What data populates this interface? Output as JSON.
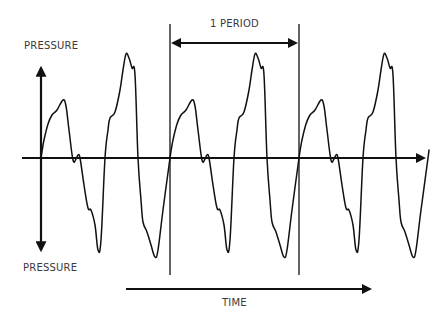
{
  "labels": {
    "pressure_top": "PRESSURE",
    "pressure_bottom": "PRESSURE",
    "period": "1 PERIOD",
    "time": "TIME"
  },
  "colors": {
    "stroke": "#111111",
    "text": "#3a3a3a",
    "background": "#ffffff"
  },
  "geometry": {
    "baseline_y": 158,
    "wave_start_x": 41,
    "period_px": 129,
    "cycles": 3,
    "period_marker_x": [
      170,
      299
    ]
  },
  "chart_data": {
    "type": "line",
    "xlabel": "TIME",
    "ylabel": "PRESSURE",
    "annotations": [
      "1 PERIOD"
    ],
    "cycles": 3,
    "relative_amplitude": {
      "small_peak": 0.58,
      "large_peak": 1.0,
      "small_trough": -0.9,
      "large_trough": -0.98
    }
  }
}
